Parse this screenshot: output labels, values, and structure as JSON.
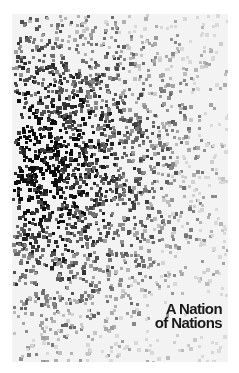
{
  "cover": {
    "title_line1": "A Nation",
    "title_line2": "of Nations",
    "background_color": "#f3f3f3",
    "frame_color": "#ffffff",
    "text_color": "#1a1a1a"
  },
  "dot_field": {
    "description": "scattered square dots, densest at left-middle, fading to the right and bottom",
    "center_x": 20,
    "center_y": 150,
    "spread_x": 95,
    "spread_y": 105,
    "count": 2600,
    "dot_size": 3,
    "seed": 7
  }
}
